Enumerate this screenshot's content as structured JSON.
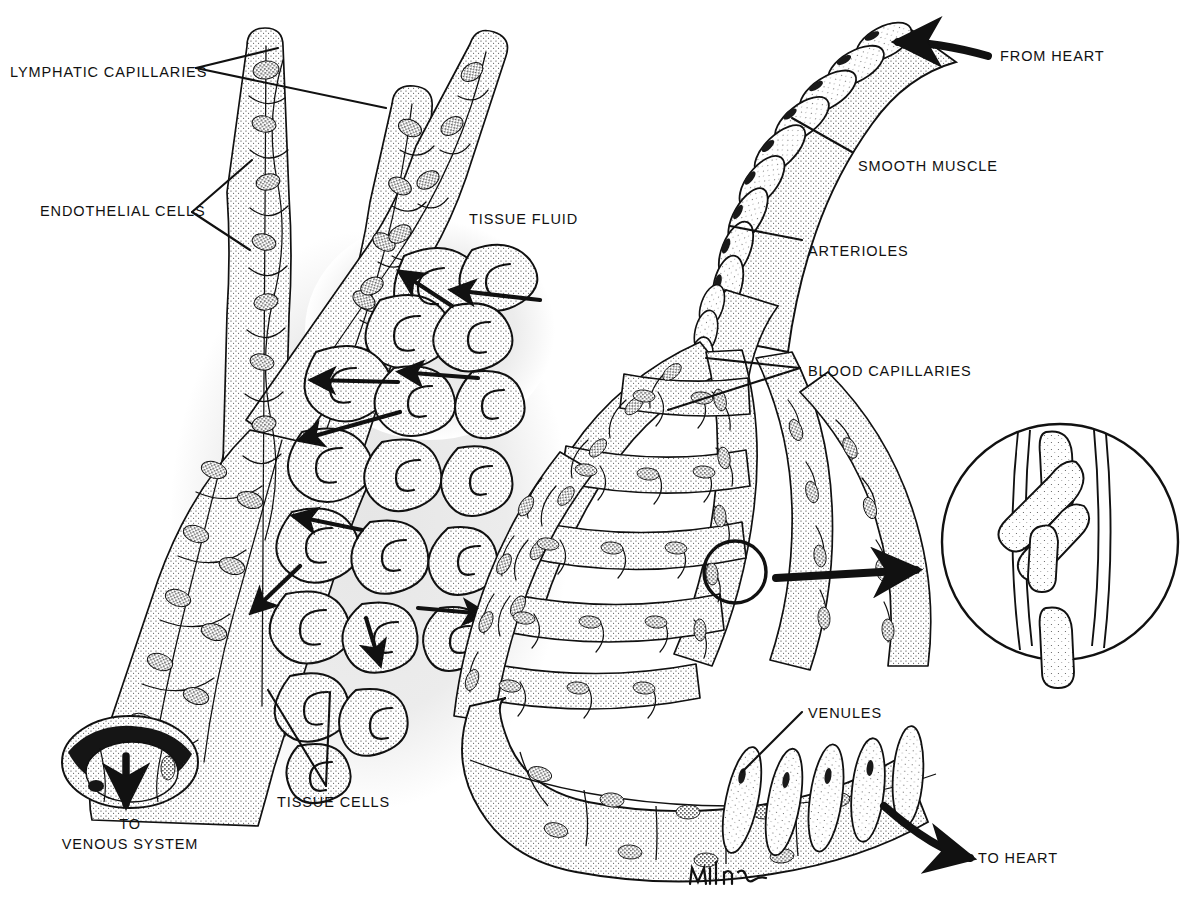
{
  "figure": {
    "signature": "Milner",
    "style": "black-and-white stippled pen-and-ink anatomical illustration",
    "background_color": "#ffffff",
    "ink_color": "#111111",
    "tissue_fluid_halo_color": "#ececec"
  },
  "labels": [
    {
      "id": "lymphatic-capillaries",
      "text": "LYMPHATIC CAPILLARIES",
      "x": 10,
      "y": 64,
      "align": "left"
    },
    {
      "id": "endothelial-cells",
      "text": "ENDOTHELIAL CELLS",
      "x": 40,
      "y": 203,
      "align": "left"
    },
    {
      "id": "tissue-fluid",
      "text": "TISSUE FLUID",
      "x": 469,
      "y": 211,
      "align": "left"
    },
    {
      "id": "tissue-cells",
      "text": "TISSUE CELLS",
      "x": 277,
      "y": 794,
      "align": "left"
    },
    {
      "id": "from-heart",
      "text": "FROM HEART",
      "x": 1000,
      "y": 48,
      "align": "left"
    },
    {
      "id": "smooth-muscle",
      "text": "SMOOTH MUSCLE",
      "x": 858,
      "y": 158,
      "align": "left"
    },
    {
      "id": "arterioles",
      "text": "ARTERIOLES",
      "x": 808,
      "y": 243,
      "align": "left"
    },
    {
      "id": "blood-capillaries",
      "text": "BLOOD CAPILLARIES",
      "x": 808,
      "y": 363,
      "align": "left"
    },
    {
      "id": "venules",
      "text": "VENULES",
      "x": 808,
      "y": 705,
      "align": "left"
    },
    {
      "id": "to-heart",
      "text": "TO HEART",
      "x": 978,
      "y": 850,
      "align": "left"
    }
  ],
  "multiline_labels": [
    {
      "id": "to-venous-system",
      "line1": "TO",
      "line2": "VENOUS SYSTEM",
      "x": 130,
      "y": 815
    }
  ],
  "flow_arrows": [
    {
      "id": "from-heart-arrow",
      "description": "thick curved arrow entering arteriole from upper right",
      "direction": "left"
    },
    {
      "id": "to-heart-arrow",
      "description": "thick curved arrow leaving venule toward lower right",
      "direction": "right"
    },
    {
      "id": "to-venous-system-arrow",
      "description": "thick straight arrow leaving cut lymphatic vessel downward",
      "direction": "down"
    },
    {
      "id": "magnifier-arrow",
      "description": "thick arrow from circled capillary to magnified inset",
      "direction": "right"
    },
    {
      "id": "tissue-fluid-arrows",
      "description": "slim arrows showing fluid moving from blood capillaries through tissue cells into lymphatic capillaries",
      "count": 9
    }
  ],
  "structures": [
    {
      "id": "lymphatic-capillary-blind-ends",
      "count": 3,
      "note": "closed blind-ended tubes, upper left"
    },
    {
      "id": "lymphatic-vessel-cut-end",
      "note": "open cut end at lower left draining to venous system"
    },
    {
      "id": "arteriole",
      "note": "vessel with spiralling smooth muscle rings, upper right"
    },
    {
      "id": "capillary-bed",
      "note": "dense anastomosing network, center right"
    },
    {
      "id": "venule",
      "note": "converging vessel with muscle bands, lower right"
    },
    {
      "id": "magnified-inset",
      "note": "circular inset showing red blood cells passing single file through a capillary",
      "rbc_count": 5
    }
  ]
}
